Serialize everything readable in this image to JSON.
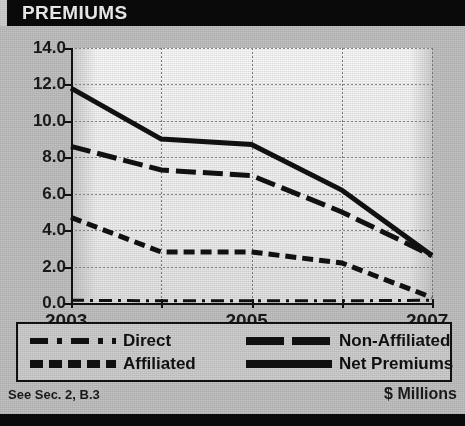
{
  "header": {
    "title": "PREMIUMS"
  },
  "footer": {
    "source_note": "See Sec. 2, B.3",
    "units": "$ Millions"
  },
  "legend": {
    "items": [
      {
        "label": "Direct",
        "style": "dash-dot"
      },
      {
        "label": "Non-Affiliated",
        "style": "long-dash"
      },
      {
        "label": "Affiliated",
        "style": "dashed"
      },
      {
        "label": "Net Premiums",
        "style": "solid"
      }
    ]
  },
  "axis": {
    "y_ticks": [
      "14.0",
      "12.0",
      "10.0",
      "8.0",
      "6.0",
      "4.0",
      "2.0",
      "0.0"
    ],
    "x_ticks_labeled": [
      "2003",
      "2005",
      "2007"
    ]
  },
  "colors": {
    "header_bg": "#0a0a0a",
    "header_text": "#f2f2f2",
    "page_bg": "#c2c2c2",
    "plot_bg": "#f4f4f4",
    "line": "#111111",
    "grid": "#8a8a8a"
  },
  "chart_data": {
    "type": "line",
    "title": "PREMIUMS",
    "xlabel": "",
    "ylabel": "",
    "units": "$ Millions",
    "x": [
      2003,
      2004,
      2005,
      2006,
      2007
    ],
    "xlim": [
      2003,
      2007
    ],
    "ylim": [
      0.0,
      14.0
    ],
    "ytick_values": [
      0.0,
      2.0,
      4.0,
      6.0,
      8.0,
      10.0,
      12.0,
      14.0
    ],
    "xtick_values": [
      2003,
      2004,
      2005,
      2006,
      2007
    ],
    "xtick_labels": [
      "2003",
      "",
      "2005",
      "",
      "2007"
    ],
    "grid": true,
    "legend_position": "below-plot",
    "series": [
      {
        "name": "Net Premiums",
        "style": "solid",
        "values": [
          11.8,
          9.0,
          8.7,
          6.2,
          2.6
        ]
      },
      {
        "name": "Non-Affiliated",
        "style": "long-dash",
        "values": [
          8.6,
          7.3,
          7.0,
          5.0,
          2.6
        ]
      },
      {
        "name": "Affiliated",
        "style": "dashed",
        "values": [
          4.7,
          2.8,
          2.8,
          2.2,
          0.3
        ]
      },
      {
        "name": "Direct",
        "style": "dash-dot",
        "values": [
          0.15,
          0.12,
          0.12,
          0.12,
          0.15
        ]
      }
    ]
  }
}
